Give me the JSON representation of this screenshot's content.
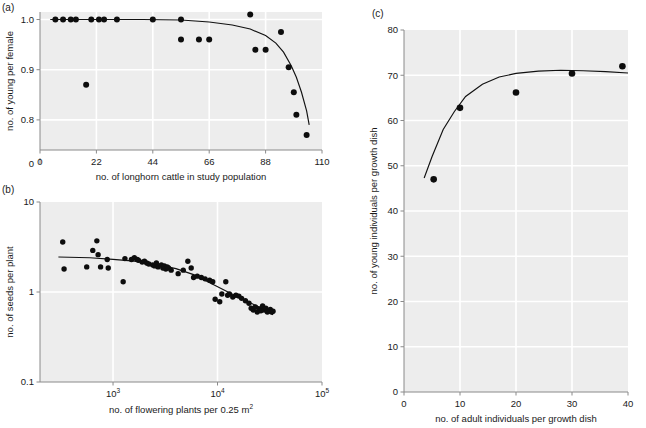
{
  "figure": {
    "background_color": "#ffffff",
    "plot_background_color": "#ededed",
    "gridline_color": "#ffffff",
    "point_color": "#0d0d0d",
    "curve_color": "#111111"
  },
  "panels": [
    {
      "id": "a",
      "label": "(a)"
    },
    {
      "id": "b",
      "label": "(b)"
    },
    {
      "id": "c",
      "label": "(c)"
    }
  ],
  "chart_data": [
    {
      "panel": "a",
      "type": "scatter",
      "title": "",
      "xlabel": "no. of longhorn cattle in study population",
      "ylabel": "no. of young per female",
      "xlim": [
        0,
        110
      ],
      "ylim": [
        0.74,
        1.015
      ],
      "xticks": [
        0,
        22,
        44,
        66,
        88,
        110
      ],
      "xticklabels": [
        "0",
        "22",
        "44",
        "66",
        "88",
        "110"
      ],
      "yticks": [
        0.8,
        0.9,
        1.0
      ],
      "yticklabels": [
        "0.8",
        "0.9",
        "1.0"
      ],
      "y_axis_break": true,
      "y_origin_label": "0",
      "grid": true,
      "legend": "none",
      "x": [
        6,
        9,
        12,
        14,
        18,
        20,
        23,
        25,
        30,
        44,
        55,
        55,
        62,
        66,
        82,
        84,
        88,
        94,
        97,
        99,
        100,
        104
      ],
      "y": [
        1.0,
        1.0,
        1.0,
        1.0,
        0.87,
        1.0,
        1.0,
        1.0,
        1.0,
        1.0,
        1.0,
        0.96,
        0.96,
        0.96,
        1.01,
        0.94,
        0.94,
        0.975,
        0.905,
        0.855,
        0.81,
        0.77
      ],
      "fit_curve": {
        "description": "flat near 1.0 then steep decline after x=88",
        "points": [
          [
            4,
            1.0
          ],
          [
            20,
            1.0
          ],
          [
            40,
            1.0
          ],
          [
            55,
            0.999
          ],
          [
            66,
            0.995
          ],
          [
            75,
            0.989
          ],
          [
            82,
            0.981
          ],
          [
            88,
            0.968
          ],
          [
            92,
            0.953
          ],
          [
            95,
            0.935
          ],
          [
            98,
            0.908
          ],
          [
            100,
            0.885
          ],
          [
            102,
            0.855
          ],
          [
            104,
            0.818
          ],
          [
            105,
            0.79
          ]
        ]
      }
    },
    {
      "panel": "b",
      "type": "scatter",
      "title": "",
      "xlabel": "no. of flowering plants per 0.25  m2",
      "xlabel_parts": [
        "no. of flowering plants per 0.25  m",
        "2"
      ],
      "ylabel": "no. of seeds per plant",
      "xscale": "log",
      "yscale": "log",
      "xlim": [
        200,
        100000
      ],
      "ylim": [
        0.1,
        10
      ],
      "xticks": [
        1000,
        10000,
        100000
      ],
      "xticklabels": [
        "103",
        "104",
        "105"
      ],
      "xtick_bases": [
        "10",
        "10",
        "10"
      ],
      "xtick_exponents": [
        "3",
        "4",
        "5"
      ],
      "yticks": [
        0.1,
        1,
        10
      ],
      "yticklabels": [
        "0.1",
        "1",
        "10"
      ],
      "grid": true,
      "legend": "none",
      "x": [
        330,
        340,
        560,
        640,
        700,
        720,
        760,
        880,
        900,
        1250,
        1300,
        1500,
        1600,
        1700,
        1750,
        1900,
        2000,
        2100,
        2200,
        2400,
        2500,
        2600,
        2700,
        2900,
        3000,
        3100,
        3200,
        3300,
        3400,
        3600,
        4200,
        4700,
        5200,
        5600,
        5900,
        6400,
        7000,
        7600,
        8400,
        9000,
        9500,
        10500,
        11000,
        12000,
        12500,
        13000,
        14000,
        15000,
        16000,
        17000,
        18500,
        20000,
        21000,
        22000,
        23000,
        24000,
        25000,
        26000,
        27000,
        28000,
        29000,
        30000,
        31000,
        32000,
        33000,
        34000
      ],
      "y": [
        3.6,
        1.8,
        1.9,
        2.9,
        3.7,
        2.6,
        1.9,
        2.3,
        1.85,
        1.3,
        2.35,
        2.3,
        2.4,
        2.3,
        2.25,
        2.15,
        2.2,
        2.1,
        2.05,
        2.0,
        1.95,
        2.1,
        1.9,
        2.0,
        1.85,
        1.95,
        1.8,
        1.9,
        1.85,
        1.75,
        1.6,
        1.75,
        2.2,
        1.85,
        1.45,
        1.5,
        1.45,
        1.4,
        1.35,
        1.3,
        0.83,
        0.78,
        0.95,
        1.3,
        0.92,
        0.95,
        0.88,
        0.92,
        0.9,
        0.85,
        0.8,
        0.75,
        0.66,
        0.63,
        0.68,
        0.6,
        0.65,
        0.62,
        0.7,
        0.63,
        0.66,
        0.6,
        0.62,
        0.64,
        0.6,
        0.61
      ],
      "fit_curve": {
        "description": "gentle decline from ~2.4 flattening then steeper decline past 10^4",
        "points": [
          [
            300,
            2.45
          ],
          [
            600,
            2.4
          ],
          [
            1000,
            2.3
          ],
          [
            1600,
            2.2
          ],
          [
            2500,
            2.05
          ],
          [
            4000,
            1.82
          ],
          [
            6000,
            1.55
          ],
          [
            9000,
            1.22
          ],
          [
            13000,
            0.98
          ],
          [
            18000,
            0.82
          ],
          [
            25000,
            0.68
          ],
          [
            34000,
            0.56
          ]
        ]
      }
    },
    {
      "panel": "c",
      "type": "scatter",
      "title": "",
      "xlabel": "no. of adult individuals per growth dish",
      "ylabel": "no. of young individuals per growth dish",
      "xlim": [
        0,
        40
      ],
      "ylim": [
        0,
        80
      ],
      "xticks": [
        0,
        10,
        20,
        30,
        40
      ],
      "xticklabels": [
        "0",
        "10",
        "20",
        "30",
        "40"
      ],
      "yticks": [
        0,
        10,
        20,
        30,
        40,
        50,
        60,
        70,
        80
      ],
      "yticklabels": [
        "0",
        "10",
        "20",
        "30",
        "40",
        "50",
        "60",
        "70",
        "80"
      ],
      "grid": true,
      "legend": "none",
      "x": [
        5.3,
        10,
        20,
        30,
        39
      ],
      "y": [
        47,
        62.8,
        66.2,
        70.4,
        72
      ],
      "fit_curve": {
        "description": "rises steeply then plateaus near 71",
        "points": [
          [
            3.6,
            47.3
          ],
          [
            5,
            52
          ],
          [
            7,
            58
          ],
          [
            9,
            62
          ],
          [
            11,
            65.3
          ],
          [
            14,
            68
          ],
          [
            17,
            69.6
          ],
          [
            20,
            70.4
          ],
          [
            24,
            70.9
          ],
          [
            28,
            71.1
          ],
          [
            32,
            71.0
          ],
          [
            36,
            70.8
          ],
          [
            40,
            70.5
          ]
        ]
      }
    }
  ]
}
